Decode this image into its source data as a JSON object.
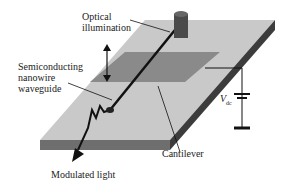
{
  "labels": {
    "optical_illumination_line1": "Optical",
    "optical_illumination_line2": "illumination",
    "nanowire_line1": "Semiconducting",
    "nanowire_line2": "nanowire",
    "nanowire_line3": "waveguide",
    "cantilever": "Cantilever",
    "modulated_light": "Modulated light",
    "vdc_main": "V",
    "vdc_sub": "dc"
  },
  "colors": {
    "substrate_top": "#c8c8c8",
    "substrate_side": "#6e6e6e",
    "substrate_edge": "#3a3a3a",
    "electrode": "#888888",
    "wire": "#111111"
  }
}
